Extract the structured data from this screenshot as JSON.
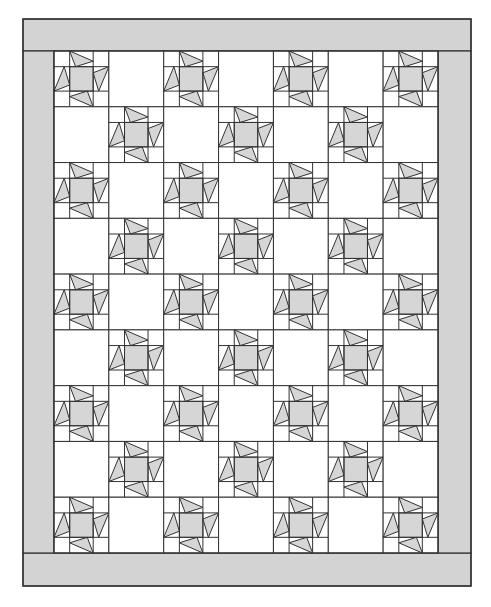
{
  "diagram": {
    "title": "Star block quilt layout",
    "type": "quilt-pattern",
    "layout": {
      "columns": 7,
      "rows": 9,
      "pattern": "alternating star blocks and plain white blocks (checkerboard)",
      "first_block": "star"
    },
    "blocks": {
      "star_block": {
        "name": "Sawtooth pinwheel star",
        "subgrid": "3x3",
        "center_fill": "#d6d6d6",
        "point_fill": "#d6d6d6",
        "background_fill": "#ffffff",
        "count": 32
      },
      "plain_block": {
        "name": "Plain setting square",
        "fill": "#ffffff",
        "count": 31
      }
    },
    "borders": {
      "top": {
        "fill": "#d3d3d3"
      },
      "bottom": {
        "fill": "#d3d3d3"
      },
      "left": {
        "fill": "#d3d3d3"
      },
      "right": {
        "fill": "#d3d3d3"
      }
    },
    "colors": {
      "outline": "#333333",
      "border_fill": "#d3d3d3",
      "star_fill": "#d6d6d6",
      "background": "#ffffff"
    }
  }
}
